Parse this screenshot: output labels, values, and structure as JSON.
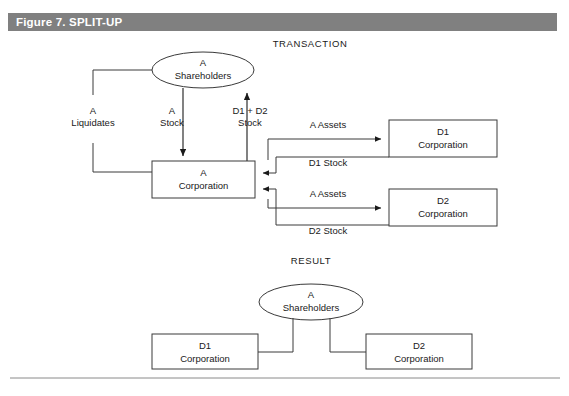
{
  "figure": {
    "header_title": "Figure 7. SPLIT-UP",
    "header_bg": "#808080",
    "header_text_color": "#ffffff"
  },
  "sections": {
    "transaction_label": "TRANSACTION",
    "result_label": "RESULT"
  },
  "transaction": {
    "shareholders": {
      "line1": "A",
      "line2": "Shareholders"
    },
    "a_corporation": {
      "line1": "A",
      "line2": "Corporation"
    },
    "d1_corporation": {
      "line1": "D1",
      "line2": "Corporation"
    },
    "d2_corporation": {
      "line1": "D2",
      "line2": "Corporation"
    },
    "edges": {
      "liquidates": {
        "line1": "A",
        "line2": "Liquidates"
      },
      "a_stock": {
        "line1": "A",
        "line2": "Stock"
      },
      "d1_d2_stock": {
        "line1": "D1 + D2",
        "line2": "Stock"
      },
      "a_assets_d1": "A  Assets",
      "d1_stock": "D1 Stock",
      "a_assets_d2": "A  Assets",
      "d2_stock": "D2 Stock"
    }
  },
  "result": {
    "shareholders": {
      "line1": "A",
      "line2": "Shareholders"
    },
    "d1_corporation": {
      "line1": "D1",
      "line2": "Corporation"
    },
    "d2_corporation": {
      "line1": "D2",
      "line2": "Corporation"
    }
  },
  "style": {
    "stroke": "#3a3a3a",
    "background": "#ffffff"
  }
}
